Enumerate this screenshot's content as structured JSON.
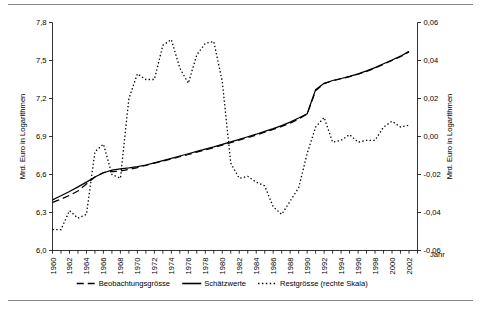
{
  "figure": {
    "background": "#ffffff",
    "frame_color": "#8a8a8a",
    "ink_color": "#000000"
  },
  "chart_data": {
    "type": "line",
    "title": "",
    "subtitle": "",
    "xlabel": "Jahr",
    "ylabel": "Mrd. Euro in Logarithmen",
    "y2label": "Mrd. Euro in Logarithmen",
    "grid": false,
    "legend_position": "bottom",
    "xlim": [
      1960,
      2003
    ],
    "ylim": [
      6.0,
      7.8
    ],
    "y2lim": [
      -0.06,
      0.06
    ],
    "yticks": [
      "6,0",
      "6,3",
      "6,6",
      "6,9",
      "7,2",
      "7,5",
      "7,8"
    ],
    "ytick_values": [
      6.0,
      6.3,
      6.6,
      6.9,
      7.2,
      7.5,
      7.8
    ],
    "y2ticks": [
      "-0,06",
      "-0,04",
      "-0,02",
      "0,00",
      "0,02",
      "0,04",
      "0,06"
    ],
    "y2tick_values": [
      -0.06,
      -0.04,
      -0.02,
      0.0,
      0.02,
      0.04,
      0.06
    ],
    "xticks": [
      "1960",
      "1962",
      "1964",
      "1966",
      "1968",
      "1970",
      "1972",
      "1974",
      "1976",
      "1978",
      "1980",
      "1982",
      "1984",
      "1986",
      "1988",
      "1990",
      "1992",
      "1994",
      "1996",
      "1998",
      "2000",
      "2002"
    ],
    "xtick_values": [
      1960,
      1962,
      1964,
      1966,
      1968,
      1970,
      1972,
      1974,
      1976,
      1978,
      1980,
      1982,
      1984,
      1986,
      1988,
      1990,
      1992,
      1994,
      1996,
      1998,
      2000,
      2002
    ],
    "x": [
      1960,
      1961,
      1962,
      1963,
      1964,
      1965,
      1966,
      1967,
      1968,
      1969,
      1970,
      1971,
      1972,
      1973,
      1974,
      1975,
      1976,
      1977,
      1978,
      1979,
      1980,
      1981,
      1982,
      1983,
      1984,
      1985,
      1986,
      1987,
      1988,
      1989,
      1990,
      1991,
      1992,
      1993,
      1994,
      1995,
      1996,
      1997,
      1998,
      1999,
      2000,
      2001,
      2002
    ],
    "series": [
      {
        "name": "Beobachtungsgrösse",
        "axis": "left",
        "style": "dashed",
        "values": [
          6.38,
          6.405,
          6.435,
          6.47,
          6.525,
          6.58,
          6.615,
          6.622,
          6.628,
          6.64,
          6.655,
          6.672,
          6.69,
          6.706,
          6.722,
          6.74,
          6.758,
          6.776,
          6.794,
          6.812,
          6.832,
          6.852,
          6.872,
          6.892,
          6.912,
          6.934,
          6.956,
          6.98,
          7.006,
          7.038,
          7.076,
          7.262,
          7.318,
          7.34,
          7.356,
          7.372,
          7.392,
          7.414,
          7.44,
          7.47,
          7.5,
          7.53,
          7.568
        ]
      },
      {
        "name": "Schätzwerte",
        "axis": "left",
        "style": "solid",
        "values": [
          6.4,
          6.432,
          6.466,
          6.502,
          6.54,
          6.58,
          6.614,
          6.634,
          6.645,
          6.652,
          6.662,
          6.675,
          6.692,
          6.71,
          6.728,
          6.746,
          6.764,
          6.782,
          6.8,
          6.818,
          6.838,
          6.858,
          6.878,
          6.898,
          6.918,
          6.94,
          6.962,
          6.986,
          7.014,
          7.046,
          7.08,
          7.27,
          7.32,
          7.342,
          7.358,
          7.374,
          7.394,
          7.418,
          7.444,
          7.474,
          7.504,
          7.534,
          7.572
        ]
      },
      {
        "name": "Restgrösse (rechte Skala)",
        "axis": "right",
        "style": "dotted",
        "values": [
          -0.049,
          -0.049,
          -0.039,
          -0.043,
          -0.041,
          -0.008,
          -0.004,
          -0.02,
          -0.022,
          0.02,
          0.033,
          0.03,
          0.03,
          0.048,
          0.051,
          0.036,
          0.028,
          0.043,
          0.049,
          0.05,
          0.029,
          -0.014,
          -0.022,
          -0.021,
          -0.024,
          -0.026,
          -0.037,
          -0.041,
          -0.034,
          -0.027,
          -0.009,
          0.005,
          0.01,
          -0.003,
          -0.002,
          0.001,
          -0.003,
          -0.002,
          -0.002,
          0.005,
          0.008,
          0.005,
          0.006
        ]
      }
    ],
    "legend": [
      {
        "label": "Beobachtungsgrösse",
        "style": "dashed"
      },
      {
        "label": "Schätzwerte",
        "style": "solid"
      },
      {
        "label": "Restgrösse (rechte Skala)",
        "style": "dotted"
      }
    ]
  }
}
